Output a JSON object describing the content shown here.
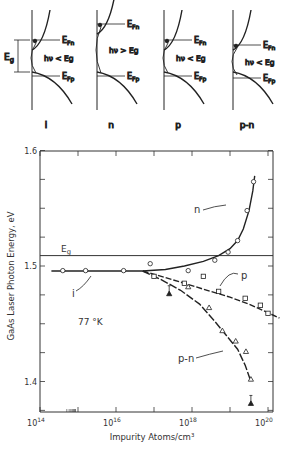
{
  "band_diagrams": [
    {
      "label": "i",
      "upper": "E_Fn",
      "lower": "E_Fp",
      "transition": "hν < E_g",
      "gap_label": "E_g"
    },
    {
      "label": "n",
      "upper": "E_Fn",
      "lower": "E_Fp",
      "transition": "hν > E_g"
    },
    {
      "label": "p",
      "upper": "E_Fn",
      "lower": "E_Fp",
      "transition": "hν < E_g"
    },
    {
      "label": "p-n",
      "upper": "E_Fn",
      "lower": "E_Fp",
      "transition": "hν < E_g"
    }
  ],
  "chart_data": {
    "type": "scatter",
    "title": "",
    "xlabel": "Impurity Atoms/cm³",
    "ylabel": "GaAs Laser Photon Energy, eV",
    "xscale": "log",
    "xlim": [
      100000000000000.0,
      1e+20
    ],
    "ylim": [
      1.374,
      1.6
    ],
    "x_ticks": [
      "10^14",
      "10^16",
      "10^18",
      "10^20"
    ],
    "y_ticks": [
      "1.4",
      "1.5",
      "1.6"
    ],
    "annotations": [
      "E_g",
      "77 °K",
      "i",
      "n",
      "p",
      "p-n"
    ],
    "reference_lines": [
      {
        "name": "E_g",
        "y": 1.509
      }
    ],
    "grid": false,
    "series": [
      {
        "name": "i",
        "marker": "circle",
        "x_log10": [
          14.6,
          15.2,
          16.2
        ],
        "y": [
          1.496,
          1.496,
          1.496
        ]
      },
      {
        "name": "n",
        "marker": "circle",
        "x_log10": [
          16.9,
          17.9,
          18.6,
          18.95,
          19.2,
          19.45,
          19.62
        ],
        "y": [
          1.502,
          1.496,
          1.505,
          1.512,
          1.522,
          1.548,
          1.573
        ]
      },
      {
        "name": "p",
        "marker": "square",
        "x_log10": [
          17.0,
          17.8,
          18.3,
          18.7,
          19.4,
          19.8,
          20.0
        ],
        "y": [
          1.491,
          1.485,
          1.491,
          1.478,
          1.472,
          1.466,
          1.459
        ]
      },
      {
        "name": "p-n",
        "marker": "triangle",
        "x_log10": [
          17.9,
          18.45,
          18.8,
          19.15,
          19.42,
          19.55
        ],
        "y": [
          1.482,
          1.464,
          1.444,
          1.435,
          1.426,
          1.402
        ]
      },
      {
        "name": "p-n (filled)",
        "marker": "filled-triangle",
        "x_log10": [
          17.4,
          19.55
        ],
        "y": [
          1.476,
          1.381
        ]
      }
    ]
  }
}
